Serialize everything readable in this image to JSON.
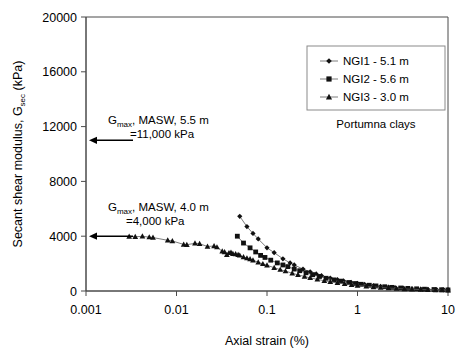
{
  "chart_data": {
    "type": "scatter",
    "title": "",
    "xlabel": "Axial strain (%)",
    "ylabel": "Secant shear modulus, G",
    "ylabel_sub": "sec",
    "ylabel_tail": " (kPa)",
    "xscale": "log",
    "xlim": [
      0.001,
      10
    ],
    "ylim": [
      0,
      20000
    ],
    "xticks": [
      0.001,
      0.01,
      0.1,
      1,
      10
    ],
    "xticklabels": [
      "0.001",
      "0.01",
      "0.1",
      "1",
      "10"
    ],
    "yticks": [
      0,
      4000,
      8000,
      12000,
      16000,
      20000
    ],
    "yticklabels": [
      "0",
      "4000",
      "8000",
      "12000",
      "16000",
      "20000"
    ],
    "grid": false,
    "legend_position": "top-right",
    "caption": "Portumna clays",
    "series": [
      {
        "name": "NGI1 - 5.1 m",
        "marker": "diamond",
        "x": [
          0.05,
          0.06,
          0.07,
          0.08,
          0.1,
          0.12,
          0.15,
          0.18,
          0.2,
          0.25,
          0.3,
          0.35,
          0.4,
          0.5,
          0.6,
          0.7,
          0.85,
          1.0,
          1.2,
          1.5,
          1.8,
          2.2,
          2.6,
          3.2,
          4.0,
          5.0,
          6.0,
          7.5,
          9.0,
          10.0
        ],
        "y": [
          5450,
          4700,
          4200,
          3800,
          3150,
          2800,
          2350,
          2050,
          1900,
          1600,
          1400,
          1250,
          1120,
          950,
          830,
          740,
          640,
          560,
          480,
          400,
          340,
          285,
          245,
          205,
          170,
          140,
          120,
          100,
          85,
          78
        ]
      },
      {
        "name": "NGI2 - 5.6 m",
        "marker": "square",
        "x": [
          0.047,
          0.055,
          0.065,
          0.075,
          0.085,
          0.095,
          0.11,
          0.13,
          0.15,
          0.17,
          0.2,
          0.23,
          0.27,
          0.32,
          0.38,
          0.45,
          0.55,
          0.65,
          0.8,
          0.95,
          1.1,
          1.35,
          1.6,
          2.0,
          2.4,
          3.0,
          3.6,
          4.5,
          5.5,
          7.0,
          8.5,
          10.0
        ],
        "y": [
          4000,
          3500,
          3150,
          2850,
          2600,
          2450,
          2250,
          2050,
          1900,
          1780,
          1600,
          1480,
          1330,
          1190,
          1060,
          930,
          810,
          720,
          620,
          545,
          490,
          420,
          370,
          310,
          265,
          220,
          190,
          158,
          132,
          108,
          92,
          80
        ]
      },
      {
        "name": "NGI3 - 3.0 m",
        "marker": "triangle",
        "x": [
          0.003,
          0.0035,
          0.0042,
          0.005,
          0.0055,
          0.008,
          0.009,
          0.012,
          0.013,
          0.016,
          0.018,
          0.022,
          0.026,
          0.028,
          0.032,
          0.034,
          0.036,
          0.038,
          0.04,
          0.042,
          0.045,
          0.048,
          0.05,
          0.055,
          0.06,
          0.065,
          0.07,
          0.08,
          0.09,
          0.1,
          0.12,
          0.14,
          0.16,
          0.19,
          0.22,
          0.26,
          0.3,
          0.36,
          0.43,
          0.5,
          0.6,
          0.72,
          0.86,
          1.0,
          1.25,
          1.5,
          1.8,
          2.2,
          2.7,
          3.3,
          4.0,
          5.0,
          6.0,
          7.3,
          8.6,
          10.0
        ],
        "y": [
          3980,
          3960,
          3990,
          3930,
          3900,
          3700,
          3650,
          3400,
          3380,
          3480,
          3450,
          3250,
          3280,
          3200,
          2900,
          2850,
          2650,
          2780,
          2820,
          2720,
          2700,
          2650,
          2600,
          2480,
          2400,
          2330,
          2250,
          2100,
          1980,
          1880,
          1700,
          1560,
          1450,
          1300,
          1180,
          1060,
          960,
          850,
          750,
          680,
          595,
          520,
          455,
          405,
          340,
          295,
          255,
          215,
          180,
          150,
          128,
          105,
          90,
          76,
          66,
          58
        ]
      }
    ],
    "annotations": [
      {
        "id": "gmax-5-5m",
        "line1_pre": "G",
        "line1_sub": "max",
        "line1_post": ", MASW, 5.5 m",
        "line2": "=11,000  kPa",
        "arrow_value": 11000,
        "arrow_label": "arrow-left"
      },
      {
        "id": "gmax-4-0m",
        "line1_pre": "G",
        "line1_sub": "max",
        "line1_post": ", MASW, 4.0 m",
        "line2": "=4,000  kPa",
        "arrow_value": 4000,
        "arrow_label": "arrow-left"
      }
    ],
    "colors": {
      "marker": "#111111",
      "line": "#5a5a5a",
      "axis": "#4a4a4a",
      "legend_border": "#8a8a8a",
      "background": "#ffffff"
    }
  }
}
